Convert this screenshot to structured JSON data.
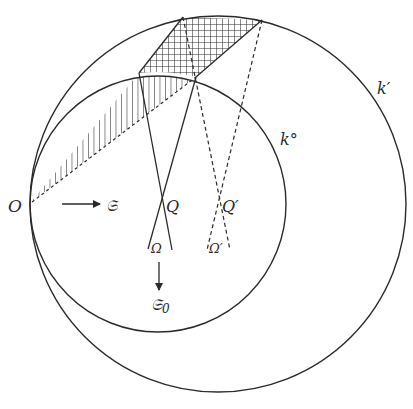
{
  "figure": {
    "colors": {
      "ink": "#2a2a2a",
      "background": "#ffffff"
    },
    "labels": {
      "O": "O",
      "S": "𝔖",
      "S0_main": "𝔖",
      "S0_sub": "0",
      "Q": "Q",
      "Q_prime": "Q′",
      "Omega": "Ω",
      "Omega_prime": "Ω′",
      "k0": "k°",
      "k_prime": "k′"
    },
    "elements": {
      "circles": [
        "k°",
        "k′"
      ],
      "hatched_regions": [
        {
          "name": "cross-hatched region",
          "style": "crosshatch"
        },
        {
          "name": "line-hatched region",
          "style": "vertical hatch"
        }
      ],
      "solid_lines": [
        "lines through Q ending at Ω"
      ],
      "dashed_lines": [
        "lines through Q′ ending at Ω′"
      ],
      "arrows": [
        "O → 𝔖",
        "Ω → 𝔖₀"
      ]
    }
  }
}
